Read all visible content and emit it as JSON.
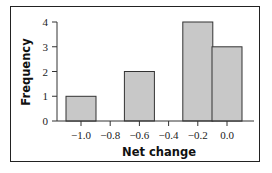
{
  "chart_data": {
    "type": "bar",
    "title": "",
    "xlabel": "Net change",
    "ylabel": "Frequency",
    "categories": [
      "-1.0",
      "-0.8",
      "-0.6",
      "-0.4",
      "-0.2",
      "0.0"
    ],
    "values": [
      1,
      0,
      2,
      0,
      4,
      3
    ],
    "x_ticks": [
      "−1.0",
      "−0.8",
      "−0.6",
      "−0.4",
      "−0.2",
      "0.0"
    ],
    "y_ticks": [
      "0",
      "1",
      "2",
      "3",
      "4"
    ],
    "ylim": [
      0,
      4
    ],
    "grid": false,
    "legend": null,
    "bar_color": "#c8c8c8",
    "bar_edge_color": "#333333"
  }
}
